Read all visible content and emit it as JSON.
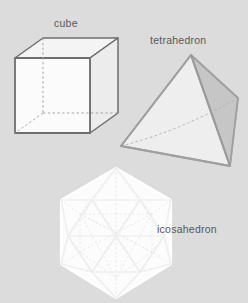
{
  "page": {
    "background_color": "#dcdcdc",
    "width": 248,
    "height": 303
  },
  "labels": {
    "cube": "cube",
    "tetrahedron": "tetrahedron",
    "icosahedron": "icosahedron"
  },
  "colors": {
    "background": "#dcdcdc",
    "label_text": "#58585a",
    "cube_stroke": "#6e6e70",
    "cube_hidden_stroke": "#9a9a9c",
    "cube_face_top": "#f2f2f2",
    "cube_face_front": "#fbfbfb",
    "cube_face_right": "#ededed",
    "tetra_stroke": "#9c9c9e",
    "tetra_hidden_stroke": "#b4b4b6",
    "tetra_face_left": "#e9e9e9",
    "tetra_face_front": "#f0f0f0",
    "tetra_face_right": "#c8c8c8",
    "icosa_stroke": "#ffffff",
    "icosa_inner_stroke": "#efefef",
    "icosa_hidden_stroke": "#e6e6e6",
    "icosa_face": "#fafafa"
  },
  "figures": [
    {
      "name": "cube",
      "label": "cube",
      "solid_type": "hexahedron",
      "faces": 6,
      "vertices": 8,
      "edges": 12,
      "shading": "light",
      "hidden_edges_dashed": true
    },
    {
      "name": "tetrahedron",
      "label": "tetrahedron",
      "solid_type": "tetrahedron",
      "faces": 4,
      "vertices": 4,
      "edges": 6,
      "shading": "right-face-dark",
      "hidden_edges_dashed": true
    },
    {
      "name": "icosahedron",
      "label": "icosahedron",
      "solid_type": "icosahedron",
      "faces": 20,
      "vertices": 12,
      "edges": 30,
      "shading": "white",
      "hidden_edges_dashed": true
    }
  ],
  "geometry": {
    "cube": {
      "front_top_left": [
        15,
        58
      ],
      "front_top_right": [
        90,
        58
      ],
      "front_bot_right": [
        90,
        133
      ],
      "front_bot_left": [
        15,
        133
      ],
      "back_top_left": [
        43,
        38
      ],
      "back_top_right": [
        118,
        38
      ],
      "back_bot_right": [
        118,
        113
      ],
      "back_bot_left": [
        43,
        88
      ]
    },
    "tetrahedron": {
      "apex": [
        191,
        55
      ],
      "left": [
        121,
        146
      ],
      "bottom_right": [
        230,
        166
      ],
      "back_right": [
        238,
        98
      ]
    },
    "icosahedron": {
      "center": [
        116,
        232
      ],
      "top_vertex": [
        116,
        168
      ],
      "bottom_vertex": [
        116,
        298
      ],
      "hex_radius": 64,
      "inner_radius": 33
    }
  }
}
